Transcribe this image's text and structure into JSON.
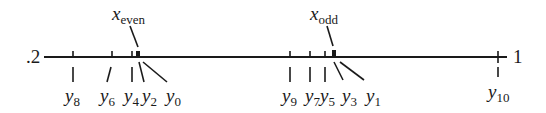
{
  "diagram": {
    "type": "number-line",
    "axis": {
      "left_label": ".2",
      "right_label": "1",
      "color": "#1a1a1a"
    },
    "ticks": [
      {
        "id": "y8",
        "x": 73
      },
      {
        "id": "y6",
        "x": 112
      },
      {
        "id": "y4",
        "x": 132
      },
      {
        "id": "even_cluster",
        "x": 138
      },
      {
        "id": "y9",
        "x": 290
      },
      {
        "id": "y7",
        "x": 310
      },
      {
        "id": "y5",
        "x": 325
      },
      {
        "id": "odd_cluster",
        "x": 334
      },
      {
        "id": "y10",
        "x": 498
      }
    ],
    "labels": {
      "y8": {
        "base": "y",
        "sub": "8"
      },
      "y6": {
        "base": "y",
        "sub": "6"
      },
      "y4": {
        "base": "y",
        "sub": "4"
      },
      "y2": {
        "base": "y",
        "sub": "2"
      },
      "y0": {
        "base": "y",
        "sub": "0"
      },
      "y9": {
        "base": "y",
        "sub": "9"
      },
      "y7": {
        "base": "y",
        "sub": "7"
      },
      "y5": {
        "base": "y",
        "sub": "5"
      },
      "y3": {
        "base": "y",
        "sub": "3"
      },
      "y1": {
        "base": "y",
        "sub": "1"
      },
      "y10": {
        "base": "y",
        "sub": "10"
      }
    },
    "fixed_points": {
      "x_even": {
        "base": "x",
        "sub": "even"
      },
      "x_odd": {
        "base": "x",
        "sub": "odd"
      }
    }
  }
}
